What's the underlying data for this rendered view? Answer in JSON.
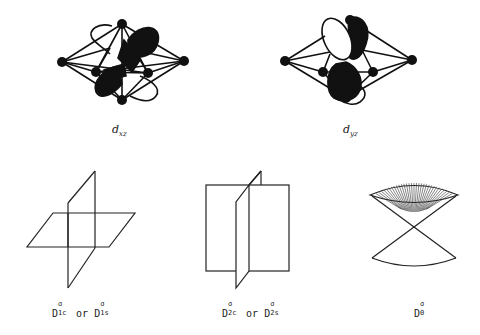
{
  "figure": {
    "top_row": [
      {
        "id": "dxz",
        "label_main": "d",
        "label_sub": "xz",
        "shading": "orbital lobes, dark/white"
      },
      {
        "id": "dyz",
        "label_main": "d",
        "label_sub": "yz",
        "shading": "orbital lobes, white upper-left, dark others"
      }
    ],
    "bottom_row": [
      {
        "id": "d1",
        "label_base": "D",
        "label_sup": "σ",
        "label_sub": "1c",
        "joiner": "or",
        "alt_base": "D",
        "alt_sup": "σ",
        "alt_sub": "1s",
        "shape": "two perpendicular planes (horizontal + vertical)"
      },
      {
        "id": "d2",
        "label_base": "D",
        "label_sup": "σ",
        "label_sub": "2c",
        "joiner": "or",
        "alt_base": "D",
        "alt_sup": "σ",
        "alt_sub": "2s",
        "shape": "two perpendicular vertical planes"
      },
      {
        "id": "d0",
        "label_base": "D",
        "label_sup": "σ",
        "label_sub": "0",
        "shape": "double cone"
      }
    ]
  },
  "colors": {
    "ink": "#111111",
    "background": "#ffffff"
  }
}
